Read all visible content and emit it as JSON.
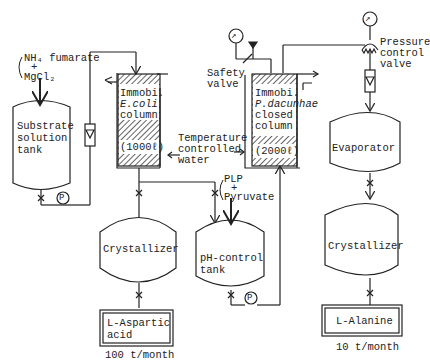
{
  "inputs": {
    "feed_left": {
      "line1": "NH₄ fumarate",
      "plus": "+",
      "line2": "MgCl₂"
    },
    "feed_mid": {
      "line1": "PLP",
      "plus": "+",
      "line2": "Pyruvate"
    }
  },
  "units": {
    "substrate_tank": {
      "line1": "Substrate",
      "line2": "solution",
      "line3": "tank"
    },
    "ecoli_column": {
      "line1": "Immobi.",
      "line2": "E.coli",
      "line3": "column",
      "volume": "(1000ℓ)"
    },
    "pdacunhae_column": {
      "line1": "Immobi.",
      "line2": "P.dacunhae",
      "line3": "closed",
      "line4": "column",
      "volume": "(2000ℓ)"
    },
    "crystallizer_left": {
      "label": "Crystallizer"
    },
    "ph_tank": {
      "line1": "pH-control",
      "line2": "tank"
    },
    "evaporator": {
      "label": "Evaporator"
    },
    "crystallizer_right": {
      "label": "Crystallizer"
    }
  },
  "annotations": {
    "temperature": {
      "line1": "Temperature",
      "line2": "controlled",
      "line3": "water"
    },
    "safety_valve": {
      "line1": "Safety",
      "line2": "valve"
    },
    "pressure_valve": {
      "line1": "Pressure",
      "line2": "control",
      "line3": "valve"
    }
  },
  "products": {
    "aspartic": {
      "line1": "L-Aspartic",
      "line2": "acid",
      "rate": "100 t/month"
    },
    "alanine": {
      "label": "L-Alanine",
      "rate": "10 t/month"
    }
  },
  "symbols": {
    "pump": "P"
  },
  "colors": {
    "line": "#222222",
    "background": "#ffffff"
  }
}
